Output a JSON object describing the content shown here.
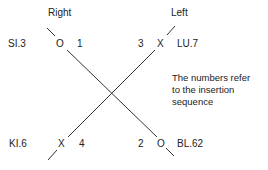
{
  "diagram": {
    "side_labels": {
      "right": "Right",
      "left": "Left"
    },
    "points": [
      {
        "name": "SI.3",
        "marker": "O",
        "order": "1",
        "position": "top-right-side"
      },
      {
        "name": "LU.7",
        "marker": "X",
        "order": "3",
        "position": "top-left-side"
      },
      {
        "name": "KI.6",
        "marker": "X",
        "order": "4",
        "position": "bottom-right-side"
      },
      {
        "name": "BL.62",
        "marker": "O",
        "order": "2",
        "position": "bottom-left-side"
      }
    ],
    "note": [
      "The numbers refer",
      "to the insertion",
      "sequence"
    ],
    "line_color": "#333333"
  }
}
